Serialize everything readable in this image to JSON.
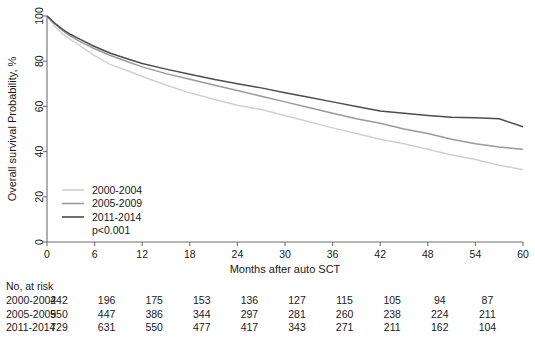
{
  "chart_data": {
    "type": "line",
    "title": "",
    "xlabel": "Months after auto SCT",
    "ylabel": "Overall survival Probability, %",
    "xlim": [
      0,
      60
    ],
    "ylim": [
      0,
      100
    ],
    "xticks": [
      0,
      6,
      12,
      18,
      24,
      30,
      36,
      42,
      48,
      54,
      60
    ],
    "yticks": [
      0,
      20,
      40,
      60,
      80,
      100
    ],
    "grid": false,
    "legend_position": "inside-lower-left",
    "annotations": [
      "p<0.001"
    ],
    "series": [
      {
        "name": "2000-2004",
        "color": "#d0d0d0",
        "x": [
          0,
          1,
          2,
          3,
          4,
          6,
          8,
          10,
          12,
          15,
          18,
          21,
          24,
          27,
          30,
          33,
          36,
          39,
          42,
          45,
          48,
          51,
          54,
          57,
          60
        ],
        "values": [
          100,
          95.5,
          92.0,
          89.5,
          87.2,
          82.5,
          78.5,
          76.0,
          73.2,
          69.5,
          66.0,
          63.2,
          60.5,
          58.6,
          56.0,
          53.2,
          50.5,
          48.0,
          45.5,
          43.5,
          41.0,
          38.5,
          36.5,
          34.0,
          32.0
        ]
      },
      {
        "name": "2005-2009",
        "color": "#9a9a9a",
        "x": [
          0,
          1,
          2,
          3,
          4,
          6,
          8,
          10,
          12,
          15,
          18,
          21,
          24,
          27,
          30,
          33,
          36,
          39,
          42,
          45,
          48,
          51,
          54,
          57,
          60
        ],
        "values": [
          100,
          96.5,
          93.5,
          91.0,
          89.0,
          85.5,
          82.5,
          80.0,
          77.5,
          74.5,
          72.0,
          69.5,
          67.0,
          64.5,
          62.0,
          59.5,
          57.0,
          54.5,
          52.5,
          50.0,
          48.0,
          45.5,
          43.5,
          42.0,
          41.0
        ]
      },
      {
        "name": "2011-2014",
        "color": "#4d4d4d",
        "x": [
          0,
          1,
          2,
          3,
          4,
          6,
          8,
          10,
          12,
          15,
          18,
          21,
          24,
          27,
          30,
          33,
          36,
          39,
          42,
          45,
          48,
          51,
          54,
          57,
          60
        ],
        "values": [
          100,
          96.8,
          94.0,
          91.8,
          90.0,
          86.5,
          83.5,
          81.2,
          79.0,
          76.5,
          74.2,
          72.0,
          70.0,
          68.2,
          66.0,
          64.0,
          62.0,
          60.0,
          58.0,
          57.0,
          56.0,
          55.2,
          55.0,
          54.5,
          51.0
        ]
      }
    ],
    "risk_table": {
      "header": "No, at risk",
      "times": [
        0,
        6,
        12,
        18,
        24,
        30,
        36,
        42,
        48,
        54,
        60
      ],
      "rows": [
        {
          "label": "2000-2004",
          "counts": [
            242,
            196,
            175,
            153,
            136,
            127,
            115,
            105,
            94,
            87
          ]
        },
        {
          "label": "2005-2009",
          "counts": [
            550,
            447,
            386,
            344,
            297,
            281,
            260,
            238,
            224,
            211
          ]
        },
        {
          "label": "2011-2014",
          "counts": [
            729,
            631,
            550,
            477,
            417,
            343,
            271,
            211,
            162,
            104
          ]
        }
      ],
      "count_times": [
        0,
        6,
        12,
        18,
        24,
        30,
        36,
        42,
        48,
        54
      ]
    },
    "legend": [
      {
        "label": "2000-2004",
        "color": "#d0d0d0"
      },
      {
        "label": "2005-2009",
        "color": "#9a9a9a"
      },
      {
        "label": "2011-2014",
        "color": "#4d4d4d"
      }
    ],
    "pvalue": "p<0.001"
  }
}
